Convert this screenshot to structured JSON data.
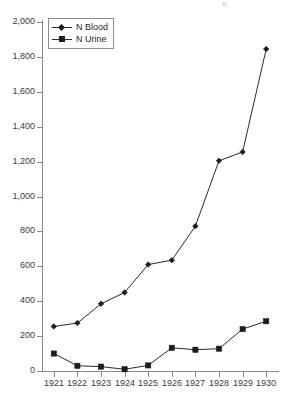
{
  "chart_data": {
    "type": "line",
    "title": "",
    "subtitle": "",
    "xlabel": "",
    "ylabel": "",
    "x": [
      1921,
      1922,
      1923,
      1924,
      1925,
      1926,
      1927,
      1928,
      1929,
      1930
    ],
    "categories": [
      "1921",
      "1922",
      "1923",
      "1924",
      "1925",
      "1926",
      "1927",
      "1928",
      "1929",
      "1930"
    ],
    "series": [
      {
        "name": "N Blood",
        "marker": "diamond",
        "color": "#1c1c1c",
        "values": [
          255,
          275,
          385,
          450,
          610,
          635,
          830,
          1205,
          1255,
          1845
        ]
      },
      {
        "name": "N Urine",
        "marker": "square",
        "color": "#1c1c1c",
        "values": [
          100,
          30,
          25,
          10,
          32,
          133,
          122,
          128,
          240,
          285
        ]
      }
    ],
    "ylim": [
      0,
      2000
    ],
    "ytick_values": [
      0,
      200,
      400,
      600,
      800,
      1000,
      1200,
      1400,
      1600,
      1800,
      2000
    ],
    "ytick_labels": [
      "0",
      "200",
      "400",
      "600",
      "800",
      "1,000",
      "1,200",
      "1,400",
      "1,600",
      "1,800",
      "2,000"
    ],
    "xtick_labels": [
      "1921",
      "1922",
      "1923",
      "1924",
      "1925",
      "1926",
      "1927",
      "1928",
      "1929",
      "1930"
    ],
    "grid": false,
    "legend_position": "top-left",
    "legend_entries": [
      "N Blood",
      "N Urine"
    ],
    "axis_color": "#8a8a8a",
    "line_color": "#2b2b2b",
    "background": "#ffffff"
  }
}
